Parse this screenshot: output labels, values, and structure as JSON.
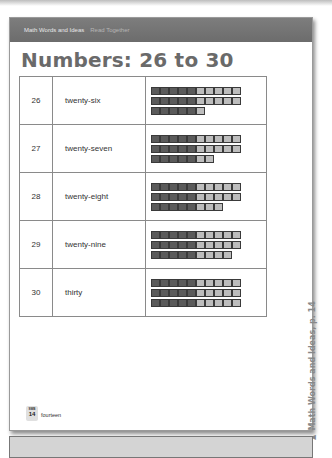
{
  "header": {
    "breadcrumb_primary": "Math Words and Ideas",
    "breadcrumb_secondary": "Read Together"
  },
  "page_title": "Numbers: 26 to 30",
  "rows": [
    {
      "number": "26",
      "word": "twenty-six",
      "bars": [
        10,
        10,
        6
      ]
    },
    {
      "number": "27",
      "word": "twenty-seven",
      "bars": [
        10,
        10,
        7
      ]
    },
    {
      "number": "28",
      "word": "twenty-eight",
      "bars": [
        10,
        10,
        8
      ]
    },
    {
      "number": "29",
      "word": "twenty-nine",
      "bars": [
        10,
        10,
        9
      ]
    },
    {
      "number": "30",
      "word": "thirty",
      "bars": [
        10,
        10,
        10
      ]
    }
  ],
  "footer": {
    "badge_label": "SWB",
    "page_number": "14",
    "page_word": "fourteen"
  },
  "side_caption": "Math Words and Ideas, p. 14",
  "side_icon": "triangle-left-icon",
  "colors": {
    "header_bg": "#737373",
    "title": "#6a6a6a",
    "dark_cell": "#5a5a5a",
    "light_cell": "#bdbdbd"
  }
}
